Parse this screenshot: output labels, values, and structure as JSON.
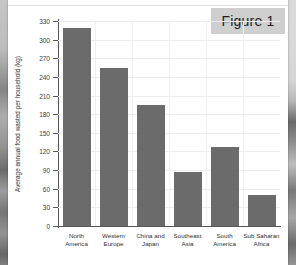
{
  "figure": {
    "badge_label": "Figure 1"
  },
  "chart_data": {
    "type": "bar",
    "title": "Figure 1",
    "xlabel": "",
    "ylabel": "Average annual food wasted per household (kg)",
    "categories": [
      "North America",
      "Western Europe",
      "China and Japan",
      "Southeast Asia",
      "South America",
      "Sub Saharan Africa"
    ],
    "category_lines": [
      [
        "North",
        "America"
      ],
      [
        "Western",
        "Europe"
      ],
      [
        "China and",
        "Japan"
      ],
      [
        "Southeast",
        "Asia"
      ],
      [
        "South",
        "America"
      ],
      [
        "Sub Saharan",
        "Africa"
      ]
    ],
    "values": [
      318,
      255,
      195,
      87,
      127,
      50
    ],
    "ylim": [
      0,
      330
    ],
    "ytick_values": [
      0,
      30,
      60,
      90,
      120,
      150,
      180,
      210,
      240,
      270,
      300,
      330
    ],
    "ytick_labels": [
      "0",
      "30",
      "60",
      "90",
      "120",
      "150",
      "180",
      "210",
      "240",
      "270",
      "300",
      "330"
    ],
    "grid": true,
    "legend": "none",
    "bar_color": "#6b6b6b",
    "axis_color": "#555555",
    "grid_color": "#ececec",
    "background_color": "#ffffff"
  },
  "colors": {
    "bar": "#6b6b6b",
    "badge_background": "#cfcfcf",
    "page_background": "#ffffff",
    "viewer_background": "#585858"
  }
}
